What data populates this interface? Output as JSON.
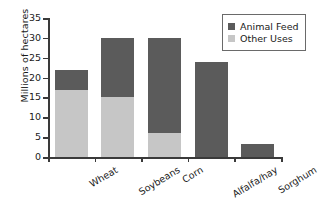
{
  "chart_data": {
    "type": "bar",
    "subtype": "stacked-bar",
    "title": "",
    "xlabel": "",
    "ylabel": "Millions of hectares",
    "categories": [
      "Wheat",
      "Soybeans",
      "Corn",
      "Alfalfa/hay",
      "Sorghum"
    ],
    "series": [
      {
        "name": "Other Uses",
        "color": "#c6c6c6",
        "values": [
          17.0,
          15.2,
          6.0,
          0.0,
          0.0
        ]
      },
      {
        "name": "Animal Feed",
        "color": "#5b5b5b",
        "values": [
          5.0,
          14.8,
          24.0,
          24.0,
          3.2
        ]
      }
    ],
    "totals": [
      22.0,
      30.0,
      30.0,
      24.0,
      3.2
    ],
    "stack_order": [
      "Other Uses",
      "Animal Feed"
    ],
    "ylim": [
      0,
      35
    ],
    "ytick_step": 5,
    "ytick_labels": [
      "0",
      "5",
      "10",
      "15",
      "20",
      "25",
      "30",
      "35"
    ],
    "grid": false,
    "legend_position": "top-right",
    "legend_entries": [
      "Animal Feed",
      "Other Uses"
    ],
    "xlabel_rotation_deg": -31
  },
  "colors": {
    "animal_feed": "#5b5b5b",
    "other_uses": "#c6c6c6",
    "axis": "#3a3a3a",
    "background": "#ffffff"
  }
}
